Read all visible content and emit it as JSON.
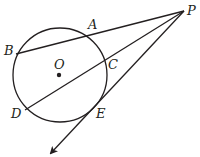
{
  "diagram": {
    "type": "geometry-circle-secants-tangent",
    "colors": {
      "stroke": "#231f20",
      "background": "#ffffff"
    },
    "circle": {
      "center_label": "O",
      "cx": 60,
      "cy": 75,
      "r": 47
    },
    "points": {
      "P": {
        "label": "P",
        "x": 184,
        "y": 11
      },
      "A": {
        "label": "A",
        "x": 95,
        "y": 34
      },
      "B": {
        "label": "B",
        "x": 16,
        "y": 54
      },
      "C": {
        "label": "C",
        "x": 103,
        "y": 65
      },
      "D": {
        "label": "D",
        "x": 25,
        "y": 110
      },
      "E": {
        "label": "E",
        "x": 89,
        "y": 113
      },
      "O": {
        "label": "O",
        "x": 59,
        "y": 75
      }
    },
    "segments": [
      {
        "name": "secant-PB",
        "from": "P",
        "to": "B",
        "through": "A"
      },
      {
        "name": "secant-PD",
        "from": "P",
        "to": "D",
        "through": "C"
      },
      {
        "name": "tangent-PE",
        "from": "P",
        "to": "E",
        "extends_with_arrow": true
      }
    ]
  }
}
